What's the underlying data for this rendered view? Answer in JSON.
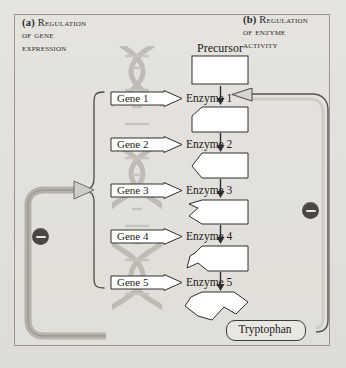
{
  "figure": {
    "background_color": "#e3e1dc",
    "border_color": "#9a978f"
  },
  "panels": {
    "a": {
      "marker": "(a)",
      "line1": "Regulation",
      "line2": "of gene",
      "line3": "expression"
    },
    "b": {
      "marker": "(b)",
      "line1": "Regulation",
      "line2": "of enzyme",
      "line3": "activity"
    }
  },
  "pathway": {
    "precursor_label": "Precursor",
    "product_label": "Tryptophan",
    "steps": [
      {
        "gene": "Gene 1",
        "enzyme": "Enzyme 1"
      },
      {
        "gene": "Gene 2",
        "enzyme": "Enzyme 2"
      },
      {
        "gene": "Gene 3",
        "enzyme": "Enzyme 3"
      },
      {
        "gene": "Gene 4",
        "enzyme": "Enzyme 4"
      },
      {
        "gene": "Gene 5",
        "enzyme": "Enzyme 5"
      }
    ]
  },
  "feedback": {
    "gene_inhibition_symbol": "−",
    "enzyme_inhibition_symbol": "−",
    "inhibition_color": "#4a4742",
    "gene_path_color": "#b4b1ab",
    "enzyme_path_color": "#7c7a74"
  },
  "graphics": {
    "dna_helix": "dna-double-helix",
    "gene_bracket": "curly-brace-bracket",
    "molecule_outline_color": "#2e2e2e",
    "molecule_fill_color": "#ffffff"
  }
}
